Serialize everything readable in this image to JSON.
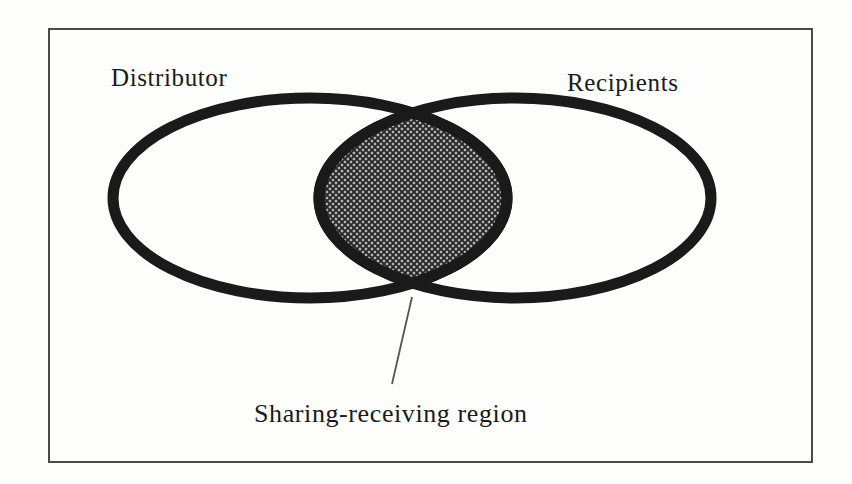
{
  "figure": {
    "type": "venn-diagram",
    "frame": {
      "x": 48,
      "y": 28,
      "width": 764,
      "height": 434,
      "border_color": "#4a4a4a",
      "border_width": 2
    },
    "background_color": "#fdfdfc",
    "stroke_color": "#1a1a1a",
    "intersection_fill_color": "#b5b5b5",
    "intersection_hatch_color": "#262626",
    "leader_line_color": "#555555"
  },
  "sets": [
    {
      "id": "distributor",
      "label": "Distributor",
      "label_position": {
        "x": 111,
        "y": 64
      },
      "ellipse": {
        "cx": 310,
        "cy": 198,
        "rx": 197,
        "ry": 100
      }
    },
    {
      "id": "recipients",
      "label": "Recipients",
      "label_position": {
        "x": 567,
        "y": 69
      },
      "ellipse": {
        "cx": 515,
        "cy": 198,
        "rx": 196,
        "ry": 100
      }
    }
  ],
  "intersection": {
    "id": "sharing-receiving-region",
    "caption": "Sharing-receiving region",
    "caption_position": {
      "x": 254,
      "y": 399
    },
    "fill": "cross-hatch",
    "leader_line": {
      "x1": 412,
      "y1": 297,
      "x2": 392,
      "y2": 384
    }
  },
  "icons": {
    "ellipse_left": "ellipse-outline-icon",
    "ellipse_right": "ellipse-outline-icon",
    "hatched_lens": "hatched-lens-icon",
    "leader": "leader-line-icon"
  }
}
